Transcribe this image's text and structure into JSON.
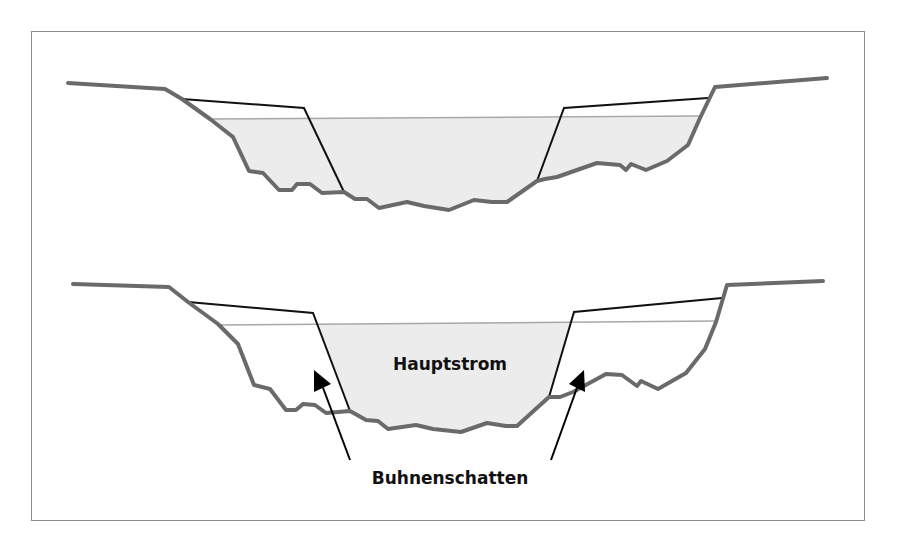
{
  "figure": {
    "type": "cross-section diagram",
    "panels": [
      {
        "id": "top",
        "description": "Cross-section with water filling the main channel and the groyne fields",
        "water_fill": "entire cross-section below water line",
        "labels": []
      },
      {
        "id": "bottom",
        "description": "Cross-section where only the main channel is shaded; groyne fields are unshaded",
        "water_fill": "main channel only",
        "labels": [
          "Hauptstrom",
          "Buhnenschatten"
        ]
      }
    ]
  },
  "labels": {
    "main_channel": "Hauptstrom",
    "groyne_shadow": "Buhnenschatten"
  },
  "colors": {
    "riverbed": "#6a6a6a",
    "groyne": "#111111",
    "water_fill": "#ececec",
    "water_line": "#a8a8a8",
    "frame": "#8c8c8c",
    "text": "#111111"
  },
  "legend": {
    "arrows": "two arrows point from 'Buhnenschatten' label into the groyne fields on either side"
  }
}
